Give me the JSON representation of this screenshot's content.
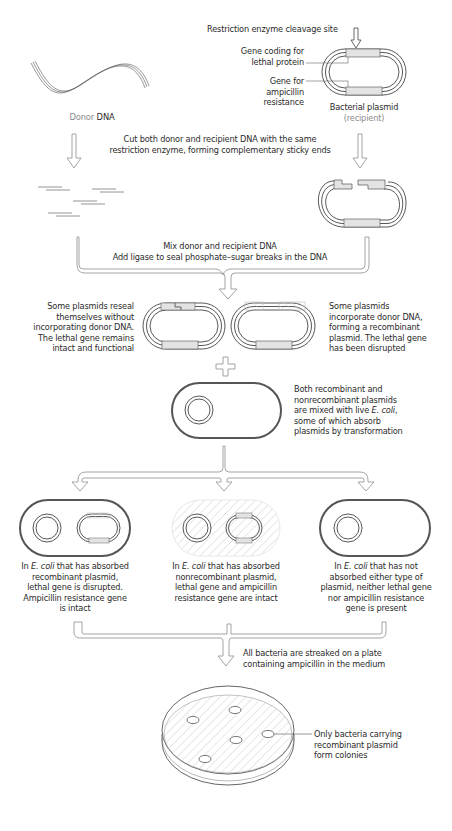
{
  "figure": {
    "type": "recombinant DNA cloning workflow",
    "colors": {
      "line": "#4a4a4a",
      "arrow_outline": "#8c8c8c",
      "gene_fill": "#e3e3e3",
      "donor_insert_fill": "#eeeeee",
      "hatch": "#c8c8c8",
      "text": "#2b2b2b",
      "muted_text": "#8a8a8a"
    }
  },
  "step1": {
    "donor_label_prefix": "Donor",
    "donor_label_main": "DNA",
    "cleavage_label": "Restriction enzyme cleavage site",
    "lethal_gene_label": "Gene coding for\nlethal protein",
    "amp_gene_label": "Gene for\nampicillin\nresistance",
    "plasmid_label": "Bacterial plasmid",
    "plasmid_sublabel": "(recipient)"
  },
  "step2": {
    "instruction": "Cut both donor and recipient DNA with the same\nrestriction enzyme, forming complementary sticky ends"
  },
  "step3": {
    "instruction_line1": "Mix donor and recipient DNA",
    "instruction_line2": "Add ligase to seal phosphate–sugar breaks in the DNA"
  },
  "step4": {
    "left_note": "Some plasmids reseal\nthemselves without\nincorporating donor DNA.\nThe lethal gene remains\nintact and functional",
    "right_note": "Some plasmids\nincorporate donor DNA,\nforming a recombinant\nplasmid. The lethal gene\nhas been disrupted"
  },
  "step5": {
    "note_line1": "Both recombinant and",
    "note_line2": "nonrecombinant plasmids",
    "note_line3_prefix": "are mixed with live ",
    "note_line3_italic": "E. coli",
    "note_line3_suffix": ",",
    "note_line4": "some of which absorb",
    "note_line5": "plasmids by transformation"
  },
  "step6": {
    "cells": [
      {
        "prefix": "In ",
        "italic": "E. coli",
        "first_line_suffix": " that has absorbed",
        "rest": "recombinant plasmid,\nlethal gene is disrupted.\nAmpicillin resistance gene\nis intact"
      },
      {
        "prefix": "In ",
        "italic": "E. coli",
        "first_line_suffix": " that has absorbed",
        "rest": "nonrecombinant plasmid,\nlethal gene and ampicillin\nresistance gene are intact"
      },
      {
        "prefix": "In ",
        "italic": "E. coli",
        "first_line_suffix": " that has not",
        "rest": "absorbed either type of\nplasmid, neither lethal gene\nnor ampicillin resistance\ngene is present"
      }
    ]
  },
  "step7": {
    "instruction": "All bacteria are streaked on  a plate\ncontaining ampicillin in the medium"
  },
  "step8": {
    "colony_note": "Only bacteria carrying\nrecombinant plasmid\nform colonies",
    "colony_count": 5
  }
}
